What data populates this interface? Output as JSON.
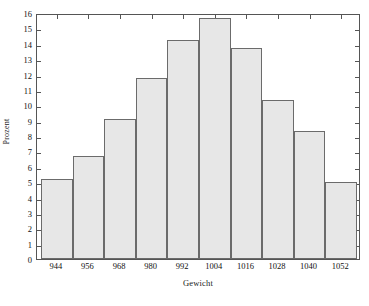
{
  "chart_data": {
    "type": "bar",
    "title": "",
    "subtitle": "",
    "xlabel": "Gewicht",
    "ylabel": "Prozent",
    "categories": [
      "944",
      "956",
      "968",
      "980",
      "992",
      "1004",
      "1016",
      "1028",
      "1040",
      "1052"
    ],
    "values": [
      5.2,
      6.7,
      9.1,
      11.75,
      14.25,
      15.65,
      13.7,
      10.35,
      8.3,
      5.0
    ],
    "series": [
      {
        "name": "Prozent",
        "values": [
          5.2,
          6.7,
          9.1,
          11.75,
          14.25,
          15.65,
          13.7,
          10.35,
          8.3,
          5.0
        ]
      }
    ],
    "xlim": [
      938,
      1058
    ],
    "ylim": [
      0,
      16
    ],
    "y_ticks": [
      0,
      1,
      2,
      3,
      4,
      5,
      6,
      7,
      8,
      9,
      10,
      11,
      12,
      13,
      14,
      15,
      16
    ],
    "y_tick_labels": [
      "0",
      "1",
      "2",
      "3",
      "4",
      "5",
      "6",
      "7",
      "8",
      "9",
      "10",
      "11",
      "12",
      "13",
      "14",
      "15",
      "16"
    ],
    "x_tick_labels": [
      "944",
      "956",
      "968",
      "980",
      "992",
      "1004",
      "1016",
      "1028",
      "1040",
      "1052"
    ],
    "bin_width": 12,
    "grid": false,
    "legend": false,
    "legend_position": "none",
    "bar_fill_color": "#e7e7e7",
    "bar_edge_color": "#6b6b6b",
    "axis_color": "#555555",
    "background_color": "#ffffff"
  }
}
